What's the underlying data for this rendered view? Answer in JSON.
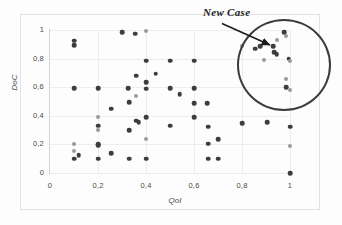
{
  "chart_data": {
    "type": "scatter",
    "title": "",
    "xlabel": "QoI",
    "ylabel": "DoC",
    "xlim": [
      0,
      1.08
    ],
    "ylim": [
      0,
      1.05
    ],
    "xticks": [
      "0",
      "0,2",
      "0,4",
      "0,6",
      "0,8",
      "1"
    ],
    "xtick_values": [
      0,
      0.2,
      0.4,
      0.6,
      0.8,
      1
    ],
    "yticks": [
      "0",
      "0,2",
      "0,4",
      "0,6",
      "0,8",
      "1"
    ],
    "ytick_values": [
      0,
      0.2,
      0.4,
      0.6,
      0.8,
      1
    ],
    "grid": true,
    "legend": "none",
    "annotations": [
      {
        "text": "New Case",
        "target_x": 0.93,
        "target_y": 0.885,
        "style": "italic-serif-with-arrow"
      }
    ],
    "highlight_region": {
      "shape": "circle",
      "center_x": 0.98,
      "center_y": 0.855,
      "radius_x": 0.196,
      "radius_y": 0.322,
      "color": "#3b3b3b"
    },
    "points": [
      {
        "x": 0.1,
        "y": 0.925,
        "shade": "dark"
      },
      {
        "x": 0.1,
        "y": 0.895,
        "shade": "dark"
      },
      {
        "x": 0.1,
        "y": 0.595,
        "shade": "dark"
      },
      {
        "x": 0.1,
        "y": 0.2,
        "shade": "light"
      },
      {
        "x": 0.1,
        "y": 0.155,
        "shade": "light"
      },
      {
        "x": 0.1,
        "y": 0.1,
        "shade": "dark"
      },
      {
        "x": 0.12,
        "y": 0.125,
        "shade": "dark"
      },
      {
        "x": 0.2,
        "y": 0.595,
        "shade": "dark"
      },
      {
        "x": 0.2,
        "y": 0.395,
        "shade": "light"
      },
      {
        "x": 0.2,
        "y": 0.33,
        "shade": "dark"
      },
      {
        "x": 0.2,
        "y": 0.3,
        "shade": "light"
      },
      {
        "x": 0.2,
        "y": 0.2,
        "shade": "dark"
      },
      {
        "x": 0.2,
        "y": 0.195,
        "shade": "dark"
      },
      {
        "x": 0.2,
        "y": 0.1,
        "shade": "dark"
      },
      {
        "x": 0.255,
        "y": 0.45,
        "shade": "dark"
      },
      {
        "x": 0.255,
        "y": 0.14,
        "shade": "dark"
      },
      {
        "x": 0.3,
        "y": 0.985,
        "shade": "dark"
      },
      {
        "x": 0.325,
        "y": 0.595,
        "shade": "dark"
      },
      {
        "x": 0.33,
        "y": 0.495,
        "shade": "dark"
      },
      {
        "x": 0.33,
        "y": 0.3,
        "shade": "dark"
      },
      {
        "x": 0.33,
        "y": 0.1,
        "shade": "dark"
      },
      {
        "x": 0.355,
        "y": 0.975,
        "shade": "dark"
      },
      {
        "x": 0.36,
        "y": 0.68,
        "shade": "dark"
      },
      {
        "x": 0.36,
        "y": 0.535,
        "shade": "light"
      },
      {
        "x": 0.36,
        "y": 0.365,
        "shade": "dark"
      },
      {
        "x": 0.37,
        "y": 0.355,
        "shade": "dark"
      },
      {
        "x": 0.4,
        "y": 0.995,
        "shade": "light"
      },
      {
        "x": 0.4,
        "y": 0.785,
        "shade": "dark"
      },
      {
        "x": 0.4,
        "y": 0.635,
        "shade": "dark"
      },
      {
        "x": 0.4,
        "y": 0.59,
        "shade": "dark"
      },
      {
        "x": 0.4,
        "y": 0.39,
        "shade": "dark"
      },
      {
        "x": 0.4,
        "y": 0.24,
        "shade": "light"
      },
      {
        "x": 0.4,
        "y": 0.1,
        "shade": "dark"
      },
      {
        "x": 0.44,
        "y": 0.695,
        "shade": "dark"
      },
      {
        "x": 0.5,
        "y": 0.785,
        "shade": "dark"
      },
      {
        "x": 0.5,
        "y": 0.595,
        "shade": "dark"
      },
      {
        "x": 0.5,
        "y": 0.33,
        "shade": "dark"
      },
      {
        "x": 0.54,
        "y": 0.55,
        "shade": "dark"
      },
      {
        "x": 0.6,
        "y": 0.785,
        "shade": "dark"
      },
      {
        "x": 0.6,
        "y": 0.595,
        "shade": "dark"
      },
      {
        "x": 0.6,
        "y": 0.49,
        "shade": "dark"
      },
      {
        "x": 0.6,
        "y": 0.39,
        "shade": "dark"
      },
      {
        "x": 0.655,
        "y": 0.49,
        "shade": "dark"
      },
      {
        "x": 0.66,
        "y": 0.325,
        "shade": "dark"
      },
      {
        "x": 0.66,
        "y": 0.205,
        "shade": "dark"
      },
      {
        "x": 0.66,
        "y": 0.1,
        "shade": "dark"
      },
      {
        "x": 0.7,
        "y": 0.235,
        "shade": "dark"
      },
      {
        "x": 0.7,
        "y": 0.1,
        "shade": "dark"
      },
      {
        "x": 0.8,
        "y": 0.35,
        "shade": "dark"
      },
      {
        "x": 0.8,
        "y": 0.885,
        "shade": "light"
      },
      {
        "x": 0.855,
        "y": 0.87,
        "shade": "dark"
      },
      {
        "x": 0.875,
        "y": 0.885,
        "shade": "dark"
      },
      {
        "x": 0.89,
        "y": 0.79,
        "shade": "light"
      },
      {
        "x": 0.905,
        "y": 0.355,
        "shade": "dark"
      },
      {
        "x": 0.93,
        "y": 0.885,
        "shade": "dark"
      },
      {
        "x": 0.935,
        "y": 0.845,
        "shade": "dark"
      },
      {
        "x": 0.945,
        "y": 0.83,
        "shade": "dark"
      },
      {
        "x": 0.945,
        "y": 0.93,
        "shade": "light"
      },
      {
        "x": 0.975,
        "y": 0.985,
        "shade": "dark"
      },
      {
        "x": 0.985,
        "y": 0.955,
        "shade": "light"
      },
      {
        "x": 0.995,
        "y": 0.8,
        "shade": "dark"
      },
      {
        "x": 1.0,
        "y": 0.785,
        "shade": "light"
      },
      {
        "x": 0.985,
        "y": 0.66,
        "shade": "light"
      },
      {
        "x": 0.985,
        "y": 0.6,
        "shade": "dark"
      },
      {
        "x": 1.0,
        "y": 0.58,
        "shade": "light"
      },
      {
        "x": 1.0,
        "y": 0.325,
        "shade": "dark"
      },
      {
        "x": 1.0,
        "y": 0.19,
        "shade": "light"
      },
      {
        "x": 1.0,
        "y": 0.0,
        "shade": "dark"
      }
    ]
  },
  "colors": {
    "dot_dark": "#3d3d3d",
    "dot_light": "#9a9a9a",
    "grid": "#ededed",
    "axis": "#c9c9c9",
    "annotation": "#1a1a1a"
  }
}
